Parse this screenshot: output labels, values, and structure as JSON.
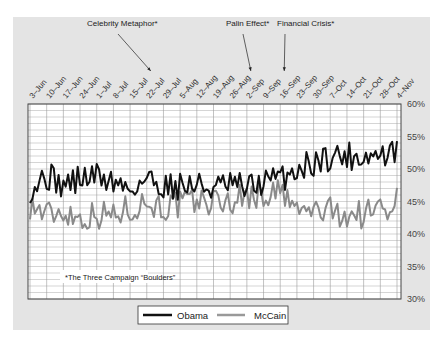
{
  "chart_data": {
    "type": "line",
    "title": "",
    "xlabel": "",
    "ylabel": "",
    "ylim": [
      30,
      60
    ],
    "y_ticks": [
      "60%",
      "55%",
      "50%",
      "45%",
      "40%",
      "35%",
      "30%"
    ],
    "y_tick_values": [
      60,
      55,
      50,
      45,
      40,
      35,
      30
    ],
    "x_ticks": [
      "3-Jun",
      "10-Jun",
      "17-Jun",
      "24-Jun",
      "1-Jul",
      "8-Jul",
      "15-Jul",
      "22-Jul",
      "29-Jul",
      "5-Aug",
      "12-Aug",
      "19-Aug",
      "26-Aug",
      "2-Sep",
      "9-Sep",
      "16-Sep",
      "23-Sep",
      "30-Sep",
      "7-Oct",
      "14-Oct",
      "21-Oct",
      "28-Oct",
      "4-Nov"
    ],
    "grid": true,
    "legend_position": "bottom",
    "annotations": [
      {
        "label": "Celebrity Metaphor*",
        "target_tick": "22-Jul"
      },
      {
        "label": "Palin Effect*",
        "target_tick": "2-Sep"
      },
      {
        "label": "Financial Crisis*",
        "target_tick": "16-Sep"
      }
    ],
    "footnote": "*The Three Campaign “Boulders”",
    "series": [
      {
        "name": "Obama",
        "color": "#111111",
        "width": 2.0,
        "weekly_values": [
          47,
          49,
          47.5,
          48.5,
          49,
          48,
          47,
          48.5,
          47.5,
          47.5,
          47.5,
          47,
          47.5,
          47,
          48,
          48.5,
          50,
          51,
          52,
          52,
          52,
          52,
          52.5
        ]
      },
      {
        "name": "McCain",
        "color": "#8a8a8a",
        "width": 2.0,
        "weekly_values": [
          44.5,
          43,
          43.5,
          42.5,
          43,
          43,
          44,
          45,
          44,
          44.5,
          45,
          45,
          45,
          46,
          46,
          46.5,
          43.5,
          43.5,
          43.5,
          43,
          43,
          44,
          45
        ]
      }
    ]
  },
  "legend": {
    "obama": "Obama",
    "mccain": "McCain"
  }
}
